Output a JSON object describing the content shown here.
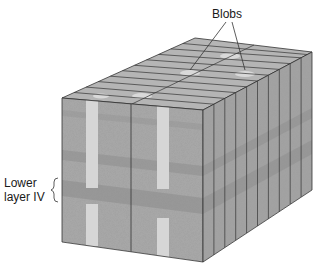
{
  "figure": {
    "labels": {
      "blobs": "Blobs",
      "lower_layer_line1": "Lower",
      "lower_layer_line2": "layer IV"
    },
    "colors": {
      "front_face": "#a9a9a9",
      "right_face": "#a3a3a3",
      "top_face": "#b5b5b5",
      "blob": "#d9d9d9",
      "band": "#8e8e8e",
      "outline": "#333333"
    }
  }
}
